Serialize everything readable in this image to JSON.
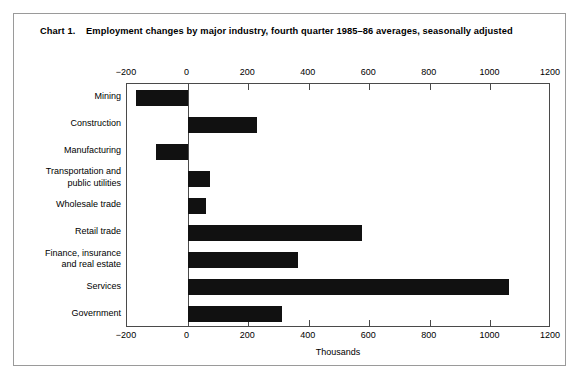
{
  "chart": {
    "label": "Chart 1.",
    "title": "Employment changes by major industry, fourth quarter 1985–86 averages, seasonally adjusted"
  },
  "chart_data": {
    "type": "bar",
    "orientation": "horizontal",
    "chart_number": "Chart 1.",
    "categories": [
      "Mining",
      "Construction",
      "Manufacturing",
      "Transportation and public utilities",
      "Wholesale trade",
      "Retail trade",
      "Finance, insurance and real estate",
      "Services",
      "Government"
    ],
    "category_lines": [
      [
        "Mining"
      ],
      [
        "Construction"
      ],
      [
        "Manufacturing"
      ],
      [
        "Transportation and",
        "public utilities"
      ],
      [
        "Wholesale trade"
      ],
      [
        "Retail trade"
      ],
      [
        "Finance, insurance",
        "and real estate"
      ],
      [
        "Services"
      ],
      [
        "Government"
      ]
    ],
    "values": [
      -170,
      228,
      -105,
      75,
      62,
      575,
      365,
      1062,
      313
    ],
    "xlabel": "Thousands",
    "ylabel": "",
    "xlim": [
      -200,
      1200
    ],
    "xticks": [
      -200,
      0,
      200,
      400,
      600,
      800,
      1000,
      1200
    ],
    "xtick_labels": [
      "−200",
      "0",
      "200",
      "400",
      "600",
      "800",
      "1000",
      "1200"
    ],
    "axis_top": true,
    "axis_bottom": true,
    "grid": false,
    "legend": null,
    "bar_color": "#111111",
    "background_color": "#ffffff"
  }
}
